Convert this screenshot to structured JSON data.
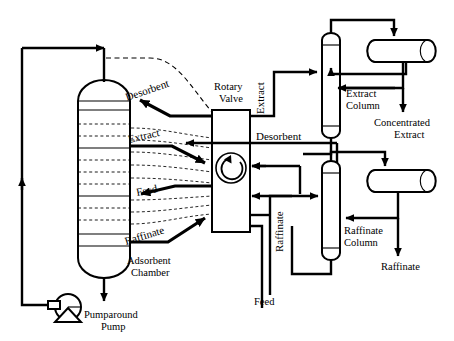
{
  "diagram": {
    "type": "process-flow-diagram",
    "background_color": "#ffffff",
    "line_color": "#000000"
  },
  "equipment": {
    "adsorbent_chamber": {
      "label_line1": "Adsorbent",
      "label_line2": "Chamber",
      "shape": "vertical-vessel-domed-ends",
      "bed_count": 12
    },
    "rotary_valve": {
      "label_line1": "Rotary",
      "label_line2": "Valve",
      "shape": "rectangle-with-rotation-arrow",
      "icon": "rotation-arrow-icon"
    },
    "pumparound_pump": {
      "label_line1": "Pumparound",
      "label_line2": "Pump",
      "shape": "centrifugal-pump",
      "icon": "pump-icon"
    },
    "extract_column": {
      "label_line1": "Extract",
      "label_line2": "Column",
      "shape": "vertical-column"
    },
    "extract_drum": {
      "label": "",
      "shape": "horizontal-drum",
      "icon": "overhead-receiver-icon"
    },
    "raffinate_column": {
      "label_line1": "Raffinate",
      "label_line2": "Column",
      "shape": "vertical-column"
    },
    "raffinate_drum": {
      "label": "",
      "shape": "horizontal-drum",
      "icon": "overhead-receiver-icon"
    }
  },
  "stream_labels": {
    "chamber_ports": [
      {
        "name": "desorbent-port",
        "text": "Desorbent",
        "rotation": -19
      },
      {
        "name": "extract-port",
        "text": "Extract",
        "rotation": -13
      },
      {
        "name": "feed-port",
        "text": "Feed",
        "rotation": -11
      },
      {
        "name": "raffinate-port",
        "text": "Raffinate",
        "rotation": -17
      }
    ],
    "valve_outlets": [
      {
        "name": "extract-line-label",
        "text": "Extract",
        "orientation": "vertical"
      },
      {
        "name": "desorbent-line-label",
        "text": "Desorbent",
        "orientation": "horizontal"
      },
      {
        "name": "raffinate-line-label",
        "text": "Raffinate",
        "orientation": "vertical"
      }
    ],
    "feed_inlet": "Feed",
    "products": [
      {
        "name": "concentrated-extract-outlet",
        "line1": "Concentrated",
        "line2": "Extract"
      },
      {
        "name": "raffinate-outlet",
        "line1": "Raffinate",
        "line2": ""
      }
    ]
  }
}
